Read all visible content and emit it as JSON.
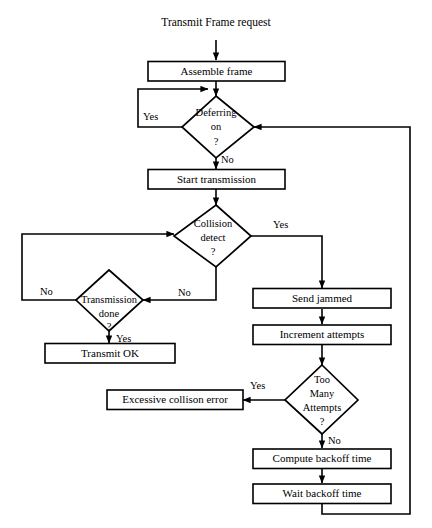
{
  "diagram": {
    "type": "flowchart",
    "title_text": "Transmit Frame request",
    "nodes": [
      {
        "id": "start",
        "shape": "text",
        "label": "Transmit Frame request"
      },
      {
        "id": "assemble",
        "shape": "process",
        "label": "Assemble frame"
      },
      {
        "id": "deferring",
        "shape": "decision",
        "line1": "Deferring",
        "line2": "on",
        "line3": "?"
      },
      {
        "id": "start_tx",
        "shape": "process",
        "label": "Start transmission"
      },
      {
        "id": "collision",
        "shape": "decision",
        "line1": "Collision",
        "line2": "detect",
        "line3": "?"
      },
      {
        "id": "tx_done",
        "shape": "decision",
        "line1": "Transmission",
        "line2": "done",
        "line3": "?"
      },
      {
        "id": "transmit_ok",
        "shape": "process",
        "label": "Transmit OK"
      },
      {
        "id": "send_jammed",
        "shape": "process",
        "label": "Send jammed"
      },
      {
        "id": "increment",
        "shape": "process",
        "label": "Increment attempts"
      },
      {
        "id": "too_many",
        "shape": "decision",
        "line1": "Too",
        "line2": "Many",
        "line3": "Attempts",
        "line4": "?"
      },
      {
        "id": "excessive",
        "shape": "process",
        "label": "Excessive collison error"
      },
      {
        "id": "compute_backoff",
        "shape": "process",
        "label": "Compute backoff time"
      },
      {
        "id": "wait_backoff",
        "shape": "process",
        "label": "Wait backoff time"
      }
    ],
    "edge_labels": {
      "deferring_yes": "Yes",
      "deferring_no": "No",
      "collision_yes": "Yes",
      "collision_no": "No",
      "txdone_no_left": "No",
      "txdone_yes": "Yes",
      "toomany_yes": "Yes",
      "toomany_no": "No"
    },
    "colors": {
      "stroke": "#000000",
      "fill": "#ffffff",
      "background": "#ffffff"
    }
  }
}
